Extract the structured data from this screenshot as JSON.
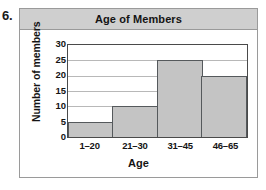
{
  "problem": {
    "number": "6."
  },
  "chart_data": {
    "type": "bar",
    "title": "Age of Members",
    "xlabel": "Age",
    "ylabel": "Number of members",
    "categories": [
      "1–20",
      "21–30",
      "31–45",
      "46–65"
    ],
    "values": [
      5,
      10,
      25,
      20
    ],
    "ylim": [
      0,
      30
    ],
    "ytick_labels": [
      "30",
      "25",
      "20",
      "15",
      "10",
      "5",
      "0"
    ],
    "ytick_values": [
      30,
      25,
      20,
      15,
      10,
      5,
      0
    ],
    "ytick_step": 5,
    "grid": true,
    "legend": null,
    "colors": {
      "bar_fill": "#c4c4c4",
      "bar_stroke": "#55595c",
      "gridline": "#b8b8b8",
      "plot_border": "#4a4a4a",
      "title_band": "#cfcfcf",
      "frame_border": "#9a9a9a",
      "text": "#141414"
    }
  }
}
